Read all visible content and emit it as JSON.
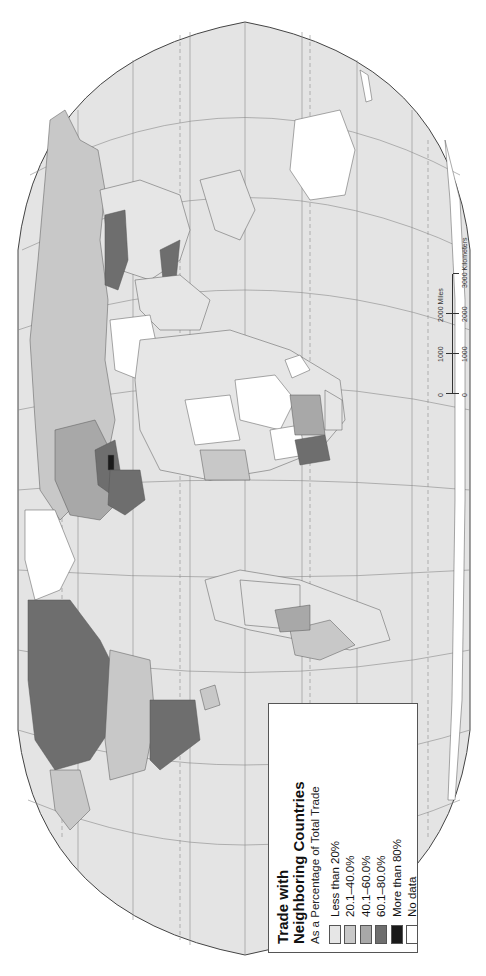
{
  "map": {
    "title": "Trade with Neighboring Countries",
    "title_line1": "Trade with",
    "title_line2": "Neighboring Countries",
    "subtitle": "As a Percentage of Total Trade",
    "orientation": "rotated 90 degrees counter-clockwise",
    "projection": "world (Robinson-like oval)"
  },
  "legend": {
    "items": [
      {
        "label": "Less than 20%",
        "color": "#e6e6e6"
      },
      {
        "label": "20.1–40.0%",
        "color": "#c8c8c8"
      },
      {
        "label": "40.1–60.0%",
        "color": "#a8a8a8"
      },
      {
        "label": "60.1–80.0%",
        "color": "#6e6e6e"
      },
      {
        "label": "More than 80%",
        "color": "#1a1a1a"
      },
      {
        "label": "No data",
        "color": "#ffffff"
      }
    ]
  },
  "scale": {
    "miles_label": "2000 Miles",
    "km_label": "3000 Kilometers",
    "miles_ticks": [
      "0",
      "1000",
      "2000"
    ],
    "km_ticks": [
      "0",
      "1000",
      "2000",
      "3000"
    ]
  },
  "colors": {
    "ocean": "#e4e4e4",
    "graticule": "#8a8a8a",
    "border": "#555555"
  }
}
